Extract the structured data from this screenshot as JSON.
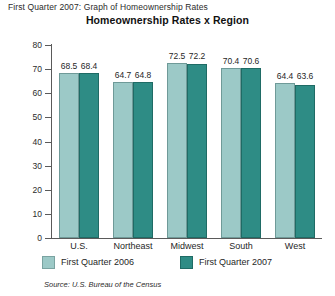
{
  "caption": "First Quarter 2007: Graph of Homeownership Rates",
  "source_note": "Source: U.S. Bureau of the Census",
  "colors": {
    "series_2006": "#9cc9c7",
    "series_2007": "#2e8c85",
    "axis": "#5a5a5a",
    "background": "#ffffff"
  },
  "chart_data": {
    "type": "bar",
    "title": "Homeownership Rates x Region",
    "xlabel": "",
    "ylabel": "Percent",
    "ylim": [
      0,
      80
    ],
    "yticks": [
      0,
      10,
      20,
      30,
      40,
      50,
      60,
      70,
      80
    ],
    "grid": false,
    "legend_position": "bottom",
    "categories": [
      "U.S.",
      "Northeast",
      "Midwest",
      "South",
      "West"
    ],
    "series": [
      {
        "name": "First Quarter 2006",
        "color": "#9cc9c7",
        "values": [
          68.5,
          64.7,
          72.5,
          70.4,
          64.4
        ]
      },
      {
        "name": "First Quarter 2007",
        "color": "#2e8c85",
        "values": [
          68.4,
          64.8,
          72.2,
          70.6,
          63.6
        ]
      }
    ]
  }
}
